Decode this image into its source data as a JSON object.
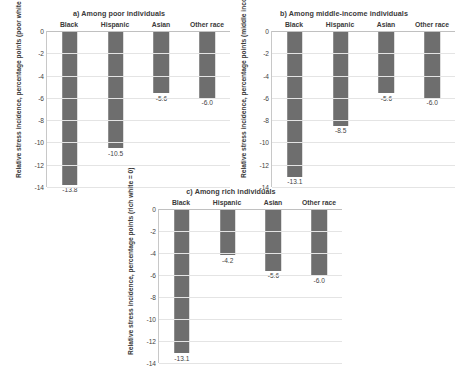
{
  "chart_data": [
    {
      "type": "bar",
      "panel": "a",
      "title": "a) Among poor individuals",
      "categories": [
        "Black",
        "Hispanic",
        "Asian",
        "Other race"
      ],
      "values": [
        -13.8,
        -10.5,
        -5.6,
        -6.0
      ],
      "value_labels": [
        "-13.8",
        "-10.5",
        "-5.6",
        "-6.0"
      ],
      "xlabel": "",
      "ylabel": "Relative stress incidence, percentage points (poor white  = 0)",
      "ylim": [
        -14,
        0
      ],
      "yticks": [
        0,
        -2,
        -4,
        -6,
        -8,
        -10,
        -12,
        -14
      ],
      "ytick_labels": [
        "0",
        "-2",
        "-4",
        "-6",
        "-8",
        "-10",
        "-12",
        "-14"
      ],
      "grid": true,
      "legend": "none",
      "bar_color": "#6e6e6e"
    },
    {
      "type": "bar",
      "panel": "b",
      "title": "b) Among middle-income individuals",
      "categories": [
        "Black",
        "Hispanic",
        "Asian",
        "Other race"
      ],
      "values": [
        -13.1,
        -8.5,
        -5.6,
        -6.0
      ],
      "value_labels": [
        "-13.1",
        "-8.5",
        "-5.6",
        "-6.0"
      ],
      "xlabel": "",
      "ylabel": "Relative stress incidence, percentage points (middle income white  = 0)",
      "ylim": [
        -14,
        0
      ],
      "yticks": [
        0,
        -2,
        -4,
        -6,
        -8,
        -10,
        -12,
        -14
      ],
      "ytick_labels": [
        "0",
        "-2",
        "-4",
        "-6",
        "-8",
        "-10",
        "-12",
        "-14"
      ],
      "grid": true,
      "legend": "none",
      "bar_color": "#6e6e6e"
    },
    {
      "type": "bar",
      "panel": "c",
      "title": "c) Among rich individuals",
      "categories": [
        "Black",
        "Hispanic",
        "Asian",
        "Other race"
      ],
      "values": [
        -13.1,
        -4.2,
        -5.6,
        -6.0
      ],
      "value_labels": [
        "-13.1",
        "-4.2",
        "-5.6",
        "-6.0"
      ],
      "xlabel": "",
      "ylabel": "Relative stress incidence, percentage points (rich white  = 0)",
      "ylim": [
        -14,
        0
      ],
      "yticks": [
        0,
        -2,
        -4,
        -6,
        -8,
        -10,
        -12,
        -14
      ],
      "ytick_labels": [
        "0",
        "-2",
        "-4",
        "-6",
        "-8",
        "-10",
        "-12",
        "-14"
      ],
      "grid": true,
      "legend": "none",
      "bar_color": "#6e6e6e"
    }
  ],
  "colors": {
    "bar": "#6e6e6e",
    "gridline": "#e4e4e4",
    "axis": "#c8c8c8",
    "text": "#3f3f3f",
    "background": "#ffffff"
  }
}
